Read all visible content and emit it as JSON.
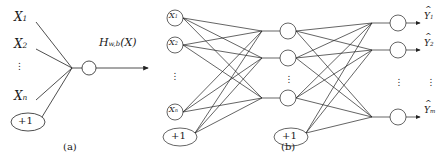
{
  "figure": {
    "background": "#ffffff",
    "stroke": "#222222",
    "panels": [
      {
        "id": "a",
        "caption": "(a)",
        "caption_pos": [
          70,
          141
        ],
        "inputs": [
          {
            "name": "X",
            "sub": "1",
            "x": 14,
            "y": 18
          },
          {
            "name": "X",
            "sub": "2",
            "x": 14,
            "y": 45
          },
          {
            "name": "X",
            "sub": "n",
            "x": 14,
            "y": 97
          }
        ],
        "ellipsis": {
          "x": 22,
          "y": 63
        },
        "bias": {
          "label": "+1",
          "cx": 28,
          "cy": 122,
          "rx": 17,
          "ry": 9
        },
        "junction": [
          72,
          68
        ],
        "neuron": {
          "cx": 89,
          "cy": 68,
          "r": 7
        },
        "output_label": {
          "text": "H",
          "sub": "w,b",
          "arg": "(X)",
          "x": 99,
          "y": 43
        },
        "arrow_end": [
          151,
          68
        ]
      },
      {
        "id": "b",
        "caption": "(b)",
        "caption_pos": [
          288,
          141
        ],
        "input_nodes": [
          {
            "name": "X",
            "sub": "1",
            "cx": 175,
            "cy": 18,
            "r": 8
          },
          {
            "name": "X",
            "sub": "2",
            "cx": 175,
            "cy": 45,
            "r": 8
          },
          {
            "name": "X",
            "sub": "n",
            "cx": 175,
            "cy": 112,
            "r": 8
          }
        ],
        "input_ellipsis": {
          "x": 175,
          "y": 74
        },
        "input_bias": {
          "label": "+1",
          "cx": 180,
          "cy": 137,
          "rx": 17,
          "ry": 9
        },
        "hidden_nodes": [
          {
            "cx": 288,
            "cy": 31,
            "r": 8
          },
          {
            "cx": 288,
            "cy": 58,
            "r": 8
          },
          {
            "cx": 288,
            "cy": 98,
            "r": 8
          }
        ],
        "hidden_ellipsis": {
          "x": 288,
          "y": 77
        },
        "hidden_bias": {
          "label": "+1",
          "cx": 291,
          "cy": 137,
          "rx": 17,
          "ry": 9
        },
        "hidden_junctions": [
          [
            262,
            31
          ],
          [
            262,
            58
          ],
          [
            262,
            98
          ]
        ],
        "output_junctions": [
          [
            372,
            23
          ],
          [
            372,
            50
          ],
          [
            372,
            117
          ]
        ],
        "output_nodes": [
          {
            "cx": 398,
            "cy": 23,
            "r": 8
          },
          {
            "cx": 398,
            "cy": 50,
            "r": 8
          },
          {
            "cx": 398,
            "cy": 117,
            "r": 8
          }
        ],
        "output_ellipsis": {
          "x": 398,
          "y": 80
        },
        "output_labels": [
          {
            "name": "Y",
            "sub": "1",
            "x": 425,
            "y": 13
          },
          {
            "name": "Y",
            "sub": "2",
            "x": 425,
            "y": 40
          },
          {
            "name": "Y",
            "sub": "m",
            "x": 425,
            "y": 107
          }
        ],
        "label_ellipsis": {
          "x": 429,
          "y": 80
        }
      }
    ]
  }
}
